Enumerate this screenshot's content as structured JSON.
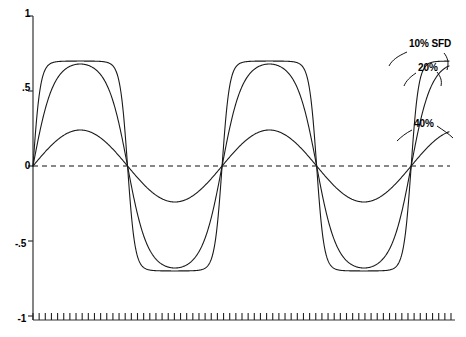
{
  "chart_data": {
    "type": "line",
    "title": "",
    "subtitle": "",
    "xlabel": "",
    "ylabel": "",
    "xlim": [
      0,
      4
    ],
    "ylim": [
      -1,
      1
    ],
    "grid": false,
    "legend_position": "right-inline-annotations",
    "y_ticks": [
      {
        "value": 1,
        "label": "1"
      },
      {
        "value": 0.5,
        "label": ".5"
      },
      {
        "value": 0,
        "label": "0"
      },
      {
        "value": -0.5,
        "label": "-.5"
      },
      {
        "value": -1,
        "label": "-1"
      }
    ],
    "x_ticks": {
      "labels": [],
      "minor_tick_count": 68,
      "description": "dense unlabeled minor ticks along baseline"
    },
    "zero_reference_line": {
      "value": 0,
      "style": "dashed"
    },
    "series": [
      {
        "name": "10% SFD",
        "label": "10% SFD",
        "waveform": "clipped-square",
        "amplitude": 0.7,
        "periods": 2.2,
        "clip_level": 0.7,
        "values": [
          0,
          0.34,
          0.62,
          0.7,
          0.7,
          0.7,
          0.7,
          0.7,
          0.62,
          0.34,
          0,
          -0.34,
          -0.62,
          -0.7,
          -0.7,
          -0.7,
          -0.7,
          -0.7,
          -0.62,
          -0.34,
          0,
          0.34,
          0.62,
          0.7,
          0.7,
          0.7,
          0.7,
          0.7,
          0.62,
          0.34,
          0,
          -0.34,
          -0.62,
          -0.7,
          -0.7,
          -0.7,
          -0.7,
          -0.7,
          -0.62,
          -0.34,
          0,
          0.34,
          0.62,
          0.7
        ]
      },
      {
        "name": "20%",
        "label": "20%",
        "waveform": "rounded-sine",
        "amplitude": 0.68,
        "periods": 2.2,
        "values": [
          0,
          0.28,
          0.5,
          0.63,
          0.68,
          0.67,
          0.6,
          0.47,
          0.3,
          0.12,
          0,
          -0.28,
          -0.5,
          -0.63,
          -0.68,
          -0.67,
          -0.6,
          -0.47,
          -0.3,
          -0.12,
          0,
          0.28,
          0.5,
          0.63,
          0.68,
          0.67,
          0.6,
          0.47,
          0.3,
          0.12,
          0,
          -0.28,
          -0.5,
          -0.63,
          -0.68,
          -0.67,
          -0.6,
          -0.47,
          -0.3,
          -0.12,
          0,
          0.28,
          0.5,
          0.68
        ]
      },
      {
        "name": "40%",
        "label": "40%",
        "waveform": "sine",
        "amplitude": 0.24,
        "periods": 2.2,
        "values": [
          0,
          0.09,
          0.17,
          0.22,
          0.24,
          0.24,
          0.22,
          0.17,
          0.09,
          0.04,
          0,
          -0.09,
          -0.17,
          -0.22,
          -0.24,
          -0.24,
          -0.22,
          -0.17,
          -0.09,
          -0.04,
          0,
          0.09,
          0.17,
          0.22,
          0.24,
          0.24,
          0.22,
          0.17,
          0.09,
          0.04,
          0,
          -0.09,
          -0.17,
          -0.22,
          -0.24,
          -0.24,
          -0.22,
          -0.17,
          -0.09,
          -0.04,
          0,
          0.09,
          0.17,
          0.24
        ]
      }
    ],
    "annotations": [
      {
        "text": "10% SFD",
        "target_series": "10% SFD"
      },
      {
        "text": "20%",
        "target_series": "20%"
      },
      {
        "text": "40%",
        "target_series": "40%"
      }
    ],
    "colors": {
      "line": "#1a1a1a",
      "axis": "#333333",
      "background": "#ffffff"
    }
  }
}
